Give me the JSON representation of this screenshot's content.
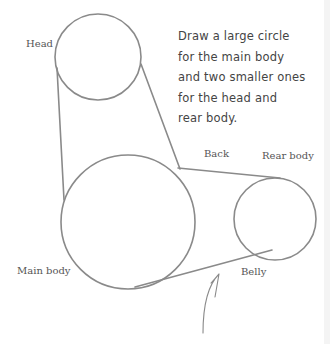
{
  "instructions": {
    "lines": [
      "Draw a large circle",
      "for the main body",
      "and two smaller ones",
      "for the head and",
      "rear body."
    ]
  },
  "labels": {
    "head": "Head",
    "back": "Back",
    "rear_body": "Rear body",
    "main_body": "Main body",
    "belly": "Belly"
  },
  "colors": {
    "stroke": "#8a8a8a",
    "text": "#555555",
    "background": "#ffffff"
  }
}
